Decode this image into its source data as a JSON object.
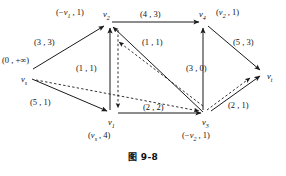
{
  "figure": {
    "caption": "图 9-8",
    "caption_number": "9-8",
    "type": "network-flow-graph"
  },
  "graph_data": {
    "type": "diagram",
    "title": "图 9-8",
    "nodes": [
      {
        "id": "vs",
        "label": "v",
        "sub": "s",
        "x": 28,
        "y": 73,
        "node_label": "(0 , +∞)",
        "node_label_x": 2,
        "node_label_y": 56
      },
      {
        "id": "v2",
        "label": "v",
        "sub": "2",
        "x": 108,
        "y": 22,
        "node_label": "(−v₁ , 1)",
        "node_label_x": 56,
        "node_label_y": 8
      },
      {
        "id": "v4",
        "label": "v",
        "sub": "4",
        "x": 204,
        "y": 22,
        "node_label": "(v₂ , 1)",
        "node_label_x": 216,
        "node_label_y": 8
      },
      {
        "id": "v1",
        "label": "v",
        "sub": "1",
        "x": 113,
        "y": 117,
        "node_label": "(v_s , 4)",
        "node_label_x": 88,
        "node_label_y": 131
      },
      {
        "id": "v3",
        "label": "v",
        "sub": "3",
        "x": 207,
        "y": 117,
        "node_label": "(−v₂ , 1)",
        "node_label_x": 182,
        "node_label_y": 131
      },
      {
        "id": "vt",
        "label": "v",
        "sub": "t",
        "x": 265,
        "y": 75,
        "node_label": "",
        "node_label_x": 0,
        "node_label_y": 0
      }
    ],
    "edges": [
      {
        "from": "vs",
        "to": "v2",
        "capacity": 3,
        "flow": 3,
        "label": "(3 , 3)",
        "label_x": 34,
        "label_y": 38,
        "style": "solid"
      },
      {
        "from": "vs",
        "to": "v1",
        "capacity": 5,
        "flow": 1,
        "label": "(5 , 1)",
        "label_x": 30,
        "label_y": 98,
        "style": "solid"
      },
      {
        "from": "v2",
        "to": "v4",
        "capacity": 4,
        "flow": 3,
        "label": "(4 , 3)",
        "label_x": 140,
        "label_y": 10,
        "style": "solid"
      },
      {
        "from": "v1",
        "to": "v2",
        "capacity": 1,
        "flow": 1,
        "label": "(1 , 1)",
        "label_x": 76,
        "label_y": 64,
        "style": "solid"
      },
      {
        "from": "v1",
        "to": "v3",
        "capacity": 2,
        "flow": 2,
        "label": "(2 , 2)",
        "label_x": 143,
        "label_y": 103,
        "style": "solid"
      },
      {
        "from": "v3",
        "to": "v2",
        "capacity": 1,
        "flow": 1,
        "label": "(1 , 1)",
        "label_x": 142,
        "label_y": 38,
        "style": "solid"
      },
      {
        "from": "v3",
        "to": "v4",
        "capacity": 3,
        "flow": 0,
        "label": "(3 , 0)",
        "label_x": 186,
        "label_y": 64,
        "style": "solid"
      },
      {
        "from": "v4",
        "to": "vt",
        "capacity": 5,
        "flow": 3,
        "label": "(5 , 3)",
        "label_x": 233,
        "label_y": 38,
        "style": "solid"
      },
      {
        "from": "v3",
        "to": "vt",
        "capacity": 2,
        "flow": 1,
        "label": "(2 , 1)",
        "label_x": 228,
        "label_y": 101,
        "style": "solid"
      }
    ],
    "augmenting_path_edges": [
      {
        "from": "vs",
        "to": "v3",
        "style": "dashed"
      },
      {
        "from": "v2",
        "to": "v1",
        "style": "dashed"
      },
      {
        "from": "v3",
        "to": "v2",
        "style": "dashed"
      },
      {
        "from": "v3",
        "to": "vt",
        "style": "dashed"
      }
    ],
    "legend": []
  }
}
